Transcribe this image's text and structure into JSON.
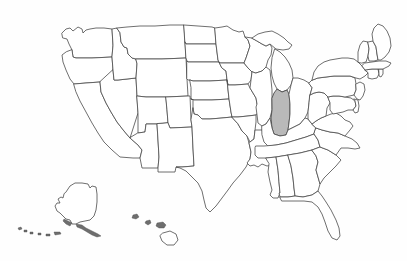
{
  "figure": {
    "kind": "choropleth-outline-map",
    "region": "United States of America",
    "title": "",
    "caption": "",
    "background_color": "#fefefe",
    "border_color": "#4a4a4a",
    "default_state_fill": "#ffffff",
    "highlight_fill": "#b9b9b9",
    "width_px": 407,
    "height_px": 261
  },
  "legend": {
    "visible": false,
    "entries": []
  },
  "highlight": {
    "state_name": "Indiana",
    "state_code": "IN",
    "fill_color": "#b9b9b9",
    "count": 1
  },
  "insets": [
    {
      "name": "Alaska",
      "code": "AK",
      "label": ""
    },
    {
      "name": "Hawaii",
      "code": "HI",
      "label": ""
    }
  ],
  "states": [
    {
      "code": "WA",
      "name": "Washington",
      "highlighted": false
    },
    {
      "code": "OR",
      "name": "Oregon",
      "highlighted": false
    },
    {
      "code": "CA",
      "name": "California",
      "highlighted": false
    },
    {
      "code": "NV",
      "name": "Nevada",
      "highlighted": false
    },
    {
      "code": "ID",
      "name": "Idaho",
      "highlighted": false
    },
    {
      "code": "MT",
      "name": "Montana",
      "highlighted": false
    },
    {
      "code": "WY",
      "name": "Wyoming",
      "highlighted": false
    },
    {
      "code": "UT",
      "name": "Utah",
      "highlighted": false
    },
    {
      "code": "AZ",
      "name": "Arizona",
      "highlighted": false
    },
    {
      "code": "NM",
      "name": "New Mexico",
      "highlighted": false
    },
    {
      "code": "CO",
      "name": "Colorado",
      "highlighted": false
    },
    {
      "code": "ND",
      "name": "North Dakota",
      "highlighted": false
    },
    {
      "code": "SD",
      "name": "South Dakota",
      "highlighted": false
    },
    {
      "code": "NE",
      "name": "Nebraska",
      "highlighted": false
    },
    {
      "code": "KS",
      "name": "Kansas",
      "highlighted": false
    },
    {
      "code": "OK",
      "name": "Oklahoma",
      "highlighted": false
    },
    {
      "code": "TX",
      "name": "Texas",
      "highlighted": false
    },
    {
      "code": "MN",
      "name": "Minnesota",
      "highlighted": false
    },
    {
      "code": "IA",
      "name": "Iowa",
      "highlighted": false
    },
    {
      "code": "MO",
      "name": "Missouri",
      "highlighted": false
    },
    {
      "code": "AR",
      "name": "Arkansas",
      "highlighted": false
    },
    {
      "code": "LA",
      "name": "Louisiana",
      "highlighted": false
    },
    {
      "code": "WI",
      "name": "Wisconsin",
      "highlighted": false
    },
    {
      "code": "IL",
      "name": "Illinois",
      "highlighted": false
    },
    {
      "code": "MI",
      "name": "Michigan",
      "highlighted": false
    },
    {
      "code": "IN",
      "name": "Indiana",
      "highlighted": true
    },
    {
      "code": "OH",
      "name": "Ohio",
      "highlighted": false
    },
    {
      "code": "KY",
      "name": "Kentucky",
      "highlighted": false
    },
    {
      "code": "TN",
      "name": "Tennessee",
      "highlighted": false
    },
    {
      "code": "MS",
      "name": "Mississippi",
      "highlighted": false
    },
    {
      "code": "AL",
      "name": "Alabama",
      "highlighted": false
    },
    {
      "code": "GA",
      "name": "Georgia",
      "highlighted": false
    },
    {
      "code": "FL",
      "name": "Florida",
      "highlighted": false
    },
    {
      "code": "SC",
      "name": "South Carolina",
      "highlighted": false
    },
    {
      "code": "NC",
      "name": "North Carolina",
      "highlighted": false
    },
    {
      "code": "VA",
      "name": "Virginia",
      "highlighted": false
    },
    {
      "code": "WV",
      "name": "West Virginia",
      "highlighted": false
    },
    {
      "code": "MD",
      "name": "Maryland",
      "highlighted": false
    },
    {
      "code": "DE",
      "name": "Delaware",
      "highlighted": false
    },
    {
      "code": "PA",
      "name": "Pennsylvania",
      "highlighted": false
    },
    {
      "code": "NJ",
      "name": "New Jersey",
      "highlighted": false
    },
    {
      "code": "NY",
      "name": "New York",
      "highlighted": false
    },
    {
      "code": "CT",
      "name": "Connecticut",
      "highlighted": false
    },
    {
      "code": "RI",
      "name": "Rhode Island",
      "highlighted": false
    },
    {
      "code": "MA",
      "name": "Massachusetts",
      "highlighted": false
    },
    {
      "code": "VT",
      "name": "Vermont",
      "highlighted": false
    },
    {
      "code": "NH",
      "name": "New Hampshire",
      "highlighted": false
    },
    {
      "code": "ME",
      "name": "Maine",
      "highlighted": false
    },
    {
      "code": "AK",
      "name": "Alaska",
      "highlighted": false
    },
    {
      "code": "HI",
      "name": "Hawaii",
      "highlighted": false
    }
  ]
}
